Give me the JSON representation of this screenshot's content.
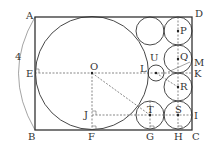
{
  "diagram": {
    "labels": {
      "A": "A",
      "B": "B",
      "C": "C",
      "D": "D",
      "E": "E",
      "F": "F",
      "G": "G",
      "H": "H",
      "I": "I",
      "J": "J",
      "K": "K",
      "L": "L",
      "M": "M",
      "O": "O",
      "P": "P",
      "Q": "Q",
      "R": "R",
      "S": "S",
      "T": "T",
      "U": "U"
    },
    "dimension_label": "4",
    "colors": {
      "stroke": "#333333",
      "background": "#ffffff"
    },
    "shapes": {
      "rectangle": [
        "A",
        "B",
        "C",
        "D"
      ],
      "large_circle": {
        "center": "O",
        "tangent_points": [
          "E",
          "F"
        ]
      },
      "small_circles": [
        "P",
        "Q",
        "R",
        "S",
        "T",
        "U",
        "top-left-of-P"
      ]
    }
  }
}
